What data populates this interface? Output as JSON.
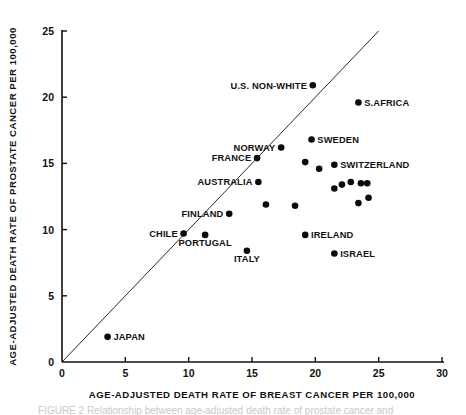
{
  "figure": {
    "title": "",
    "background": "#ffffff",
    "point_color": "#0b0b0b",
    "axis_color": "#111111"
  },
  "chart_data": {
    "type": "scatter",
    "title": "",
    "xlabel": "AGE-ADJUSTED  DEATH  RATE  OF  BREAST  CANCER  PER  100,000",
    "ylabel": "AGE-ADJUSTED  DEATH  RATE  OF  PROSTATE  CANCER  PER  100,000",
    "xlim": [
      0,
      30
    ],
    "ylim": [
      0,
      25
    ],
    "xticks": [
      0,
      5,
      10,
      15,
      20,
      25,
      30
    ],
    "yticks": [
      0,
      5,
      10,
      15,
      20,
      25
    ],
    "xticklabels": [
      "0",
      "5",
      "10",
      "15",
      "20",
      "25",
      "30"
    ],
    "yticklabels": [
      "0",
      "5",
      "10",
      "15",
      "20",
      "25"
    ],
    "grid": false,
    "legend": "none",
    "annotations": [
      {
        "text": "reference line y = x",
        "type": "line",
        "from": [
          0,
          0
        ],
        "to": [
          25,
          25
        ]
      }
    ],
    "points": [
      {
        "label": "JAPAN",
        "x": 3.6,
        "y": 1.9,
        "label_pos": "right"
      },
      {
        "label": "CHILE",
        "x": 9.6,
        "y": 9.7,
        "label_pos": "left"
      },
      {
        "label": "PORTUGAL",
        "x": 11.3,
        "y": 9.6,
        "label_pos": "below"
      },
      {
        "label": "FINLAND",
        "x": 13.2,
        "y": 11.2,
        "label_pos": "left"
      },
      {
        "label": "ITALY",
        "x": 14.6,
        "y": 8.4,
        "label_pos": "below"
      },
      {
        "label": "AUSTRALIA",
        "x": 15.5,
        "y": 13.6,
        "label_pos": "left"
      },
      {
        "label": "FRANCE",
        "x": 15.4,
        "y": 15.4,
        "label_pos": "left"
      },
      {
        "label": "NORWAY",
        "x": 17.3,
        "y": 16.2,
        "label_pos": "left"
      },
      {
        "label": "U.S. NON-WHITE",
        "x": 19.8,
        "y": 20.9,
        "label_pos": "left"
      },
      {
        "label": "SWEDEN",
        "x": 19.7,
        "y": 16.8,
        "label_pos": "right"
      },
      {
        "label": "IRELAND",
        "x": 19.2,
        "y": 9.6,
        "label_pos": "right"
      },
      {
        "label": "SWITZERLAND",
        "x": 21.5,
        "y": 14.9,
        "label_pos": "right"
      },
      {
        "label": "ISRAEL",
        "x": 21.5,
        "y": 8.2,
        "label_pos": "right"
      },
      {
        "label": "S.AFRICA",
        "x": 23.4,
        "y": 19.6,
        "label_pos": "right"
      },
      {
        "label": "",
        "x": 16.1,
        "y": 11.9,
        "label_pos": "none"
      },
      {
        "label": "",
        "x": 18.4,
        "y": 11.8,
        "label_pos": "none"
      },
      {
        "label": "",
        "x": 19.2,
        "y": 15.1,
        "label_pos": "none"
      },
      {
        "label": "",
        "x": 20.3,
        "y": 14.6,
        "label_pos": "none"
      },
      {
        "label": "",
        "x": 21.5,
        "y": 13.1,
        "label_pos": "none"
      },
      {
        "label": "",
        "x": 22.1,
        "y": 13.4,
        "label_pos": "none"
      },
      {
        "label": "",
        "x": 22.8,
        "y": 13.6,
        "label_pos": "none"
      },
      {
        "label": "",
        "x": 23.6,
        "y": 13.5,
        "label_pos": "none"
      },
      {
        "label": "",
        "x": 24.1,
        "y": 13.5,
        "label_pos": "none"
      },
      {
        "label": "",
        "x": 23.4,
        "y": 12.0,
        "label_pos": "none"
      },
      {
        "label": "",
        "x": 24.2,
        "y": 12.4,
        "label_pos": "none"
      }
    ]
  },
  "caption": {
    "text": "FIGURE 2   Relationship between age-adjusted death rate of prostate cancer and"
  }
}
